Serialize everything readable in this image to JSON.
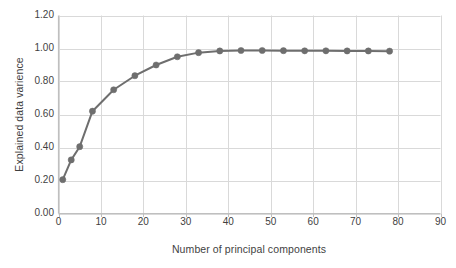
{
  "chart_data": {
    "type": "line",
    "title": "",
    "subtitle": "",
    "xlabel": "Number of principal components",
    "ylabel": "Explained data varience",
    "xlim": [
      0,
      90
    ],
    "ylim": [
      0.0,
      1.2
    ],
    "xticks": [
      0,
      10,
      20,
      30,
      40,
      50,
      60,
      70,
      80,
      90
    ],
    "xtick_labels": [
      "0",
      "10",
      "20",
      "30",
      "40",
      "50",
      "60",
      "70",
      "80",
      "90"
    ],
    "yticks": [
      0.0,
      0.2,
      0.4,
      0.6,
      0.8,
      1.0,
      1.2
    ],
    "ytick_labels": [
      "0.00",
      "0.20",
      "0.40",
      "0.60",
      "0.80",
      "1.00",
      "1.20"
    ],
    "grid": true,
    "grid_color": "#d9d9d9",
    "legend": null,
    "legend_position": "none",
    "series": [
      {
        "name": "Cumulative explained variance",
        "color": "#6e6e6e",
        "marker": "circle",
        "marker_size": 5,
        "line_width": 2,
        "x": [
          1,
          3,
          5,
          8,
          13,
          18,
          23,
          28,
          33,
          38,
          43,
          48,
          53,
          58,
          63,
          68,
          73,
          78
        ],
        "values": [
          0.205,
          0.325,
          0.405,
          0.62,
          0.75,
          0.835,
          0.9,
          0.95,
          0.975,
          0.985,
          0.988,
          0.988,
          0.987,
          0.986,
          0.986,
          0.985,
          0.985,
          0.984
        ]
      }
    ]
  },
  "axes": {
    "y_title": "Explained data varience",
    "x_title": "Number of principal components"
  },
  "colors": {
    "series": "#6e6e6e",
    "grid": "#d9d9d9",
    "axis": "#bfbfbf",
    "text": "#3f3f3f",
    "background": "#ffffff"
  }
}
